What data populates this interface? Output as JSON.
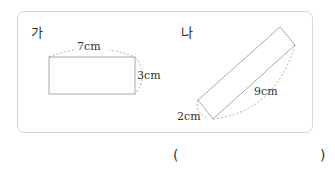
{
  "figures": [
    {
      "label": "가",
      "shape": "rectangle",
      "width": "7cm",
      "height": "3cm"
    },
    {
      "label": "나",
      "shape": "rectangle (rotated)",
      "width": "2cm",
      "length": "9cm"
    }
  ],
  "answer": {
    "open": "(",
    "close": ")"
  }
}
